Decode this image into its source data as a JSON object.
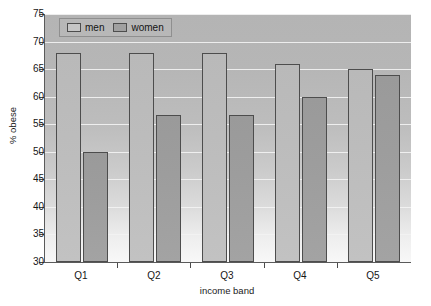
{
  "chart_data": {
    "type": "bar",
    "title": "",
    "subtitle": "",
    "xlabel": "income band",
    "ylabel": "% obese",
    "categories": [
      "Q1",
      "Q2",
      "Q3",
      "Q4",
      "Q5"
    ],
    "series": [
      {
        "name": "men",
        "values": [
          68,
          68,
          68,
          66,
          65
        ]
      },
      {
        "name": "women",
        "values": [
          50,
          56.7,
          56.7,
          60,
          64
        ]
      }
    ],
    "ylim": [
      30,
      75
    ],
    "yticks": [
      30,
      35,
      40,
      45,
      50,
      55,
      60,
      65,
      70,
      75
    ],
    "ytick_labels": [
      "30",
      "35",
      "40",
      "45",
      "50",
      "55",
      "60",
      "65",
      "70",
      "75"
    ],
    "grid": true,
    "grid_axis": "y",
    "legend_position": "top-left",
    "legend_entries": [
      "men",
      "women"
    ],
    "colors": {
      "men": "#bdbdbd",
      "women": "#9d9d9d",
      "bar_edge": "#4d4d4d",
      "gridline": "#f2f2f2",
      "axis": "#4a4a4a",
      "plot_background_top": "#b4b4b4",
      "plot_background_bottom": "#f8f8f8",
      "figure_background": "#ffffff",
      "text": "#161616"
    }
  },
  "axes": {
    "y_title": "% obese",
    "x_title": "income band"
  },
  "legend": {
    "items": [
      {
        "label": "men",
        "swatch": "legend-swatch-men"
      },
      {
        "label": "women",
        "swatch": "legend-swatch-women"
      }
    ]
  }
}
